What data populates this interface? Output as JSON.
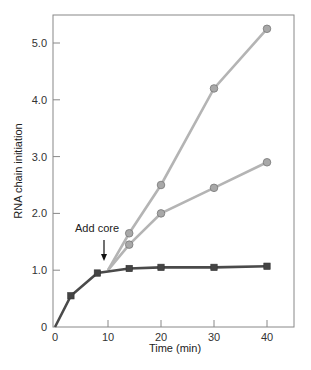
{
  "chart_data": {
    "type": "line",
    "title": "",
    "xlabel": "Time (min)",
    "ylabel": "RNA chain initiation",
    "xlim": [
      0,
      45
    ],
    "ylim": [
      0,
      5.5
    ],
    "x_ticks": [
      "0",
      "10",
      "20",
      "30",
      "40"
    ],
    "y_ticks": [
      "0",
      "1.0",
      "2.0",
      "3.0",
      "4.0",
      "5.0"
    ],
    "grid": false,
    "annotation": {
      "text": "Add core",
      "x": 10,
      "arrow": true
    },
    "series": [
      {
        "name": "baseline (squares)",
        "marker": "square",
        "color": "#444444",
        "x": [
          0,
          3,
          8,
          14,
          20,
          30,
          40
        ],
        "y": [
          0,
          0.55,
          0.95,
          1.03,
          1.05,
          1.05,
          1.07
        ]
      },
      {
        "name": "upper (circles)",
        "marker": "circle",
        "color": "#aaaaaa",
        "x": [
          10,
          14,
          20,
          30,
          40
        ],
        "y": [
          1.0,
          1.65,
          2.5,
          4.2,
          5.25
        ]
      },
      {
        "name": "middle (circles)",
        "marker": "circle",
        "color": "#aaaaaa",
        "x": [
          10,
          14,
          20,
          30,
          40
        ],
        "y": [
          1.0,
          1.45,
          2.0,
          2.45,
          2.9
        ]
      }
    ]
  }
}
